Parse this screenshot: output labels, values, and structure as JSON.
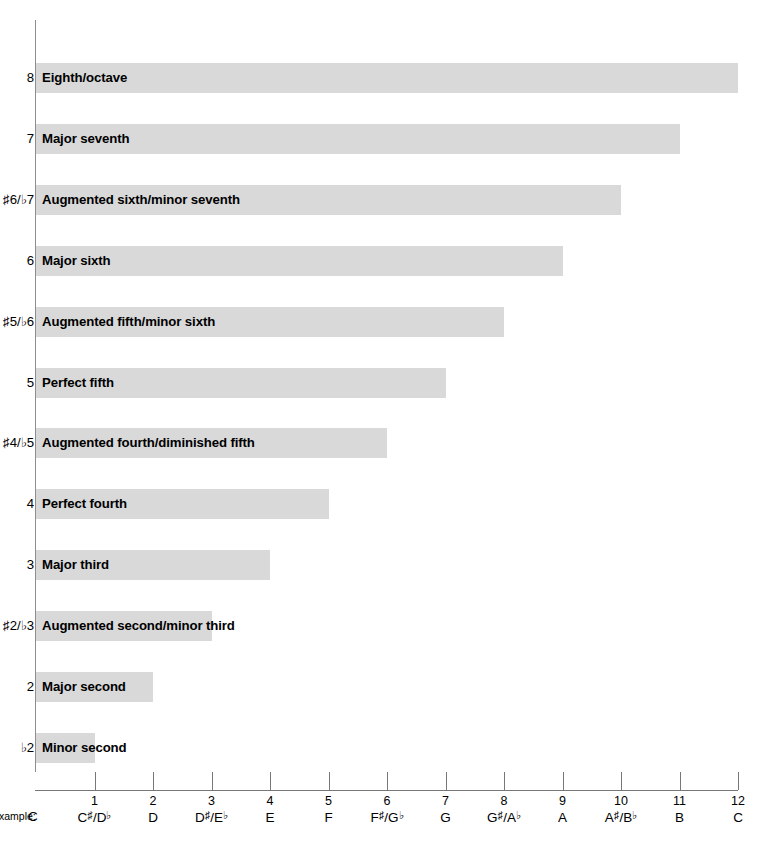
{
  "chart_data": {
    "type": "bar",
    "title": "",
    "xlabel": "",
    "ylabel": "",
    "orientation": "horizontal",
    "grid": false,
    "legend": null,
    "xlim": [
      0,
      12
    ],
    "units": "semitones",
    "categories": [
      "Minor second",
      "Major second",
      "Augmented second/minor third",
      "Major third",
      "Perfect fourth",
      "Augmented fourth/diminished fifth",
      "Perfect fifth",
      "Augmented fifth/minor sixth",
      "Major sixth",
      "Augmented sixth/minor seventh",
      "Major seventh",
      "Eighth/octave"
    ],
    "values": [
      1,
      2,
      3,
      4,
      5,
      6,
      7,
      8,
      9,
      10,
      11,
      12
    ],
    "y_tick_labels": [
      "♭2",
      "2",
      "♯2/♭3",
      "3",
      "4",
      "♯4/♭5",
      "5",
      "♯5/♭6",
      "6",
      "♯6/♭7",
      "7",
      "8"
    ],
    "x_tick_values": [
      1,
      2,
      3,
      4,
      5,
      6,
      7,
      8,
      9,
      10,
      11,
      12
    ],
    "x_tick_labels": [
      "1",
      "2",
      "3",
      "4",
      "5",
      "6",
      "7",
      "8",
      "9",
      "10",
      "11",
      "12"
    ],
    "x_tick_notes": [
      "C♯/D♭",
      "D",
      "D♯/E♭",
      "E",
      "F",
      "F♯/G♭",
      "G",
      "G♯/A♭",
      "A",
      "A♯/B♭",
      "B",
      "C"
    ],
    "bar_color": "#d9d9d9",
    "axis_color": "#8e8e8e"
  },
  "rows": [
    {
      "degree": "8",
      "degree_acc": "",
      "label": "Eighth/octave",
      "value": 12
    },
    {
      "degree": "7",
      "degree_acc": "",
      "label": "Major seventh",
      "value": 11
    },
    {
      "degree": "6/7",
      "degree_acc": "sf",
      "label": "Augmented sixth/minor seventh",
      "value": 10
    },
    {
      "degree": "6",
      "degree_acc": "",
      "label": "Major sixth",
      "value": 9
    },
    {
      "degree": "5/6",
      "degree_acc": "sf",
      "label": "Augmented fifth/minor sixth",
      "value": 8
    },
    {
      "degree": "5",
      "degree_acc": "",
      "label": "Perfect fifth",
      "value": 7
    },
    {
      "degree": "4/5",
      "degree_acc": "sf",
      "label": "Augmented fourth/diminished fifth",
      "value": 6
    },
    {
      "degree": "4",
      "degree_acc": "",
      "label": "Perfect fourth",
      "value": 5
    },
    {
      "degree": "3",
      "degree_acc": "",
      "label": "Major third",
      "value": 4
    },
    {
      "degree": "2/3",
      "degree_acc": "sf",
      "label": "Augmented second/minor third",
      "value": 3
    },
    {
      "degree": "2",
      "degree_acc": "",
      "label": "Major second",
      "value": 2
    },
    {
      "degree": "2",
      "degree_acc": "f",
      "label": "Minor second",
      "value": 1
    }
  ],
  "y_labels": [
    "8",
    "7",
    "♯6/♭7",
    "6",
    "♯5/♭6",
    "5",
    "♯4/♭5",
    "4",
    "3",
    "♯2/♭3",
    "2",
    "♭2"
  ],
  "x_axis": {
    "example_prefix": "Example:",
    "example_root": "C",
    "ticks": [
      {
        "num": "1",
        "note_letter": "C",
        "note_acc": "♯",
        "note_alt": "/D",
        "note_alt_acc": "♭"
      },
      {
        "num": "2",
        "note_letter": "D",
        "note_acc": "",
        "note_alt": "",
        "note_alt_acc": ""
      },
      {
        "num": "3",
        "note_letter": "D",
        "note_acc": "♯",
        "note_alt": "/E",
        "note_alt_acc": "♭"
      },
      {
        "num": "4",
        "note_letter": "E",
        "note_acc": "",
        "note_alt": "",
        "note_alt_acc": ""
      },
      {
        "num": "5",
        "note_letter": "F",
        "note_acc": "",
        "note_alt": "",
        "note_alt_acc": ""
      },
      {
        "num": "6",
        "note_letter": "F",
        "note_acc": "♯",
        "note_alt": "/G",
        "note_alt_acc": "♭"
      },
      {
        "num": "7",
        "note_letter": "G",
        "note_acc": "",
        "note_alt": "",
        "note_alt_acc": ""
      },
      {
        "num": "8",
        "note_letter": "G",
        "note_acc": "♯",
        "note_alt": "/A",
        "note_alt_acc": "♭"
      },
      {
        "num": "9",
        "note_letter": "A",
        "note_acc": "",
        "note_alt": "",
        "note_alt_acc": ""
      },
      {
        "num": "10",
        "note_letter": "A",
        "note_acc": "♯",
        "note_alt": "/B",
        "note_alt_acc": "♭"
      },
      {
        "num": "11",
        "note_letter": "B",
        "note_acc": "",
        "note_alt": "",
        "note_alt_acc": ""
      },
      {
        "num": "12",
        "note_letter": "C",
        "note_acc": "",
        "note_alt": "",
        "note_alt_acc": ""
      }
    ]
  }
}
